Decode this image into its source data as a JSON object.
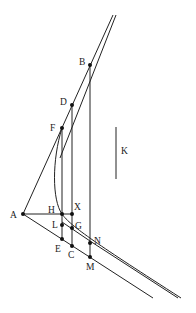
{
  "diagram": {
    "type": "geometric-construction",
    "points": [
      {
        "id": "A",
        "x": 23,
        "y": 214,
        "lx": 10,
        "ly": 218
      },
      {
        "id": "B",
        "x": 90,
        "y": 65,
        "lx": 79,
        "ly": 65
      },
      {
        "id": "D",
        "x": 72,
        "y": 105,
        "lx": 60,
        "ly": 105
      },
      {
        "id": "F",
        "x": 62,
        "y": 128,
        "lx": 50,
        "ly": 131
      },
      {
        "id": "H",
        "x": 62,
        "y": 214,
        "lx": 48,
        "ly": 213
      },
      {
        "id": "X",
        "x": 72,
        "y": 214,
        "lx": 74,
        "ly": 210
      },
      {
        "id": "L",
        "x": 62,
        "y": 225,
        "lx": 52,
        "ly": 228
      },
      {
        "id": "G",
        "x": 72,
        "y": 228,
        "lx": 75,
        "ly": 228
      },
      {
        "id": "E",
        "x": 62,
        "y": 239,
        "lx": 55,
        "ly": 252
      },
      {
        "id": "C",
        "x": 72,
        "y": 246,
        "lx": 68,
        "ly": 258
      },
      {
        "id": "N",
        "x": 90,
        "y": 243,
        "lx": 93,
        "ly": 243
      },
      {
        "id": "M",
        "x": 90,
        "y": 257,
        "lx": 86,
        "ly": 270
      }
    ],
    "segment_label": {
      "id": "K",
      "x": 121,
      "y": 153
    },
    "labels": [
      "A",
      "B",
      "C",
      "D",
      "E",
      "F",
      "G",
      "H",
      "K",
      "L",
      "M",
      "N",
      "X"
    ]
  }
}
